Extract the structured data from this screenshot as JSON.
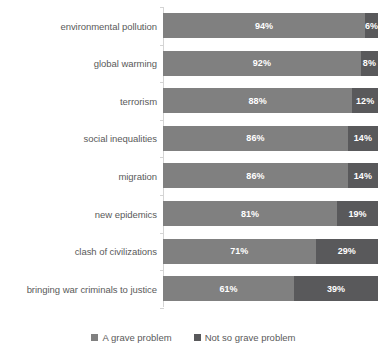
{
  "chart_data": {
    "type": "bar",
    "orientation": "horizontal",
    "stacked": true,
    "normalized": "100%",
    "title": "",
    "subtitle": "",
    "xlabel": "",
    "ylabel": "",
    "xlim": [
      0,
      100
    ],
    "grid": false,
    "legend_position": "bottom-center",
    "categories": [
      "environmental pollution",
      "global warming",
      "terrorism",
      "social inequalities",
      "migration",
      "new epidemics",
      "clash of civilizations",
      "bringing war criminals to justice"
    ],
    "series": [
      {
        "name": "A grave problem",
        "color": "#808080",
        "values": [
          94,
          92,
          88,
          86,
          86,
          81,
          71,
          61
        ],
        "labels": [
          "94%",
          "92%",
          "88%",
          "86%",
          "86%",
          "81%",
          "71%",
          "61%"
        ]
      },
      {
        "name": "Not so grave problem",
        "color": "#59595b",
        "values": [
          6,
          8,
          12,
          14,
          14,
          19,
          29,
          39
        ],
        "labels": [
          "6%",
          "8%",
          "12%",
          "14%",
          "14%",
          "19%",
          "29%",
          "39%"
        ]
      }
    ]
  },
  "legend": {
    "items": [
      {
        "label": "A grave problem",
        "color": "#808080",
        "marker": "square-marker"
      },
      {
        "label": "Not so grave problem",
        "color": "#59595b",
        "marker": "square-marker"
      }
    ]
  }
}
